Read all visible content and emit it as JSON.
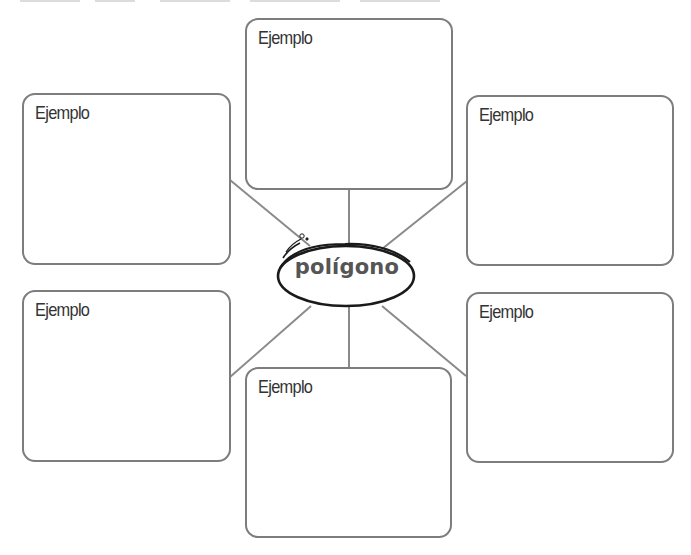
{
  "diagram": {
    "type": "concept-map",
    "center": {
      "label": "polígono"
    },
    "boxes": [
      {
        "id": "top-center",
        "label": "Ejemplo"
      },
      {
        "id": "top-left",
        "label": "Ejemplo"
      },
      {
        "id": "top-right",
        "label": "Ejemplo"
      },
      {
        "id": "bottom-left",
        "label": "Ejemplo"
      },
      {
        "id": "bottom-right",
        "label": "Ejemplo"
      },
      {
        "id": "bottom-center",
        "label": "Ejemplo"
      }
    ],
    "colors": {
      "box_border": "#7d7d7d",
      "connector": "#8a8a8a",
      "ellipse": "#1a1a1a",
      "center_text": "#555555",
      "label_text": "#333333"
    }
  }
}
